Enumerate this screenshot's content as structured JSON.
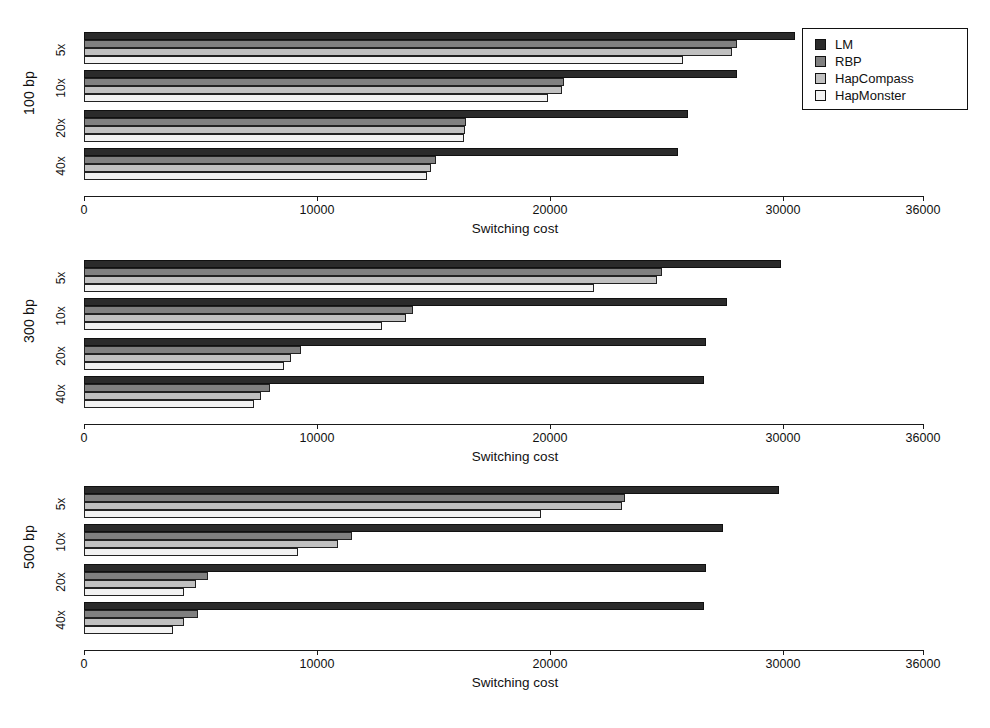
{
  "chart_data": {
    "type": "bar",
    "orientation": "horizontal",
    "title": "",
    "xlabel": "Switching cost",
    "ylabel": "",
    "xlim": [
      0,
      36000
    ],
    "xticks": [
      0,
      10000,
      20000,
      30000,
      36000
    ],
    "xticklabels": [
      "0",
      "10000",
      "20000",
      "30000",
      "36000"
    ],
    "grid": false,
    "legend_position": "top-right",
    "legend": [
      "LM",
      "RBP",
      "HapCompass",
      "HapMonster"
    ],
    "series_colors": [
      "#2b2b2b",
      "#808080",
      "#c0c0c0",
      "#f2f2f2"
    ],
    "panels": [
      {
        "label": "100 bp",
        "categories": [
          "5x",
          "10x",
          "20x",
          "40x"
        ],
        "series": [
          {
            "name": "LM",
            "values": [
              30500,
              28000,
              25900,
              25500
            ]
          },
          {
            "name": "RBP",
            "values": [
              28000,
              20600,
              16400,
              15100
            ]
          },
          {
            "name": "HapCompass",
            "values": [
              27800,
              20500,
              16350,
              14900
            ]
          },
          {
            "name": "HapMonster",
            "values": [
              25700,
              19900,
              16300,
              14700
            ]
          }
        ]
      },
      {
        "label": "300 bp",
        "categories": [
          "5x",
          "10x",
          "20x",
          "40x"
        ],
        "series": [
          {
            "name": "LM",
            "values": [
              29900,
              27600,
              26700,
              26600
            ]
          },
          {
            "name": "RBP",
            "values": [
              24800,
              14100,
              9300,
              8000
            ]
          },
          {
            "name": "HapCompass",
            "values": [
              24600,
              13800,
              8900,
              7600
            ]
          },
          {
            "name": "HapMonster",
            "values": [
              21900,
              12800,
              8600,
              7300
            ]
          }
        ]
      },
      {
        "label": "500 bp",
        "categories": [
          "5x",
          "10x",
          "20x",
          "40x"
        ],
        "series": [
          {
            "name": "LM",
            "values": [
              29800,
              27400,
              26700,
              26600
            ]
          },
          {
            "name": "RBP",
            "values": [
              23200,
              11500,
              5300,
              4900
            ]
          },
          {
            "name": "HapCompass",
            "values": [
              23100,
              10900,
              4800,
              4300
            ]
          },
          {
            "name": "HapMonster",
            "values": [
              19600,
              9200,
              4300,
              3800
            ]
          }
        ]
      }
    ]
  },
  "legend": {
    "items": [
      {
        "label": "LM"
      },
      {
        "label": "RBP"
      },
      {
        "label": "HapCompass"
      },
      {
        "label": "HapMonster"
      }
    ]
  },
  "axis": {
    "title": "Switching cost",
    "ticks": [
      "0",
      "10000",
      "20000",
      "30000",
      "36000"
    ]
  },
  "panels": [
    {
      "label": "100 bp",
      "coverages": [
        "5x",
        "10x",
        "20x",
        "40x"
      ]
    },
    {
      "label": "300 bp",
      "coverages": [
        "5x",
        "10x",
        "20x",
        "40x"
      ]
    },
    {
      "label": "500 bp",
      "coverages": [
        "5x",
        "10x",
        "20x",
        "40x"
      ]
    }
  ]
}
